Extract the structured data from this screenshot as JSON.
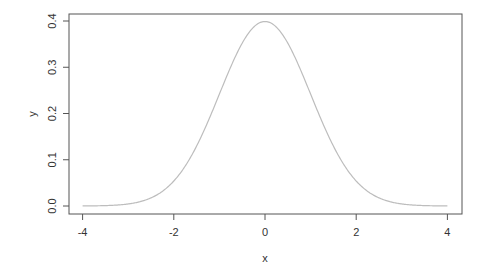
{
  "chart_data": {
    "type": "line",
    "title": "",
    "xlabel": "x",
    "ylabel": "y",
    "xlim": [
      -4.3,
      4.3
    ],
    "ylim": [
      -0.016,
      0.416
    ],
    "x_ticks": [
      "-4",
      "-2",
      "0",
      "2",
      "4"
    ],
    "y_ticks": [
      "0.0",
      "0.1",
      "0.2",
      "0.3",
      "0.4"
    ],
    "grid": false,
    "legend": null,
    "series": [
      {
        "name": "dnorm(x)",
        "color": "#bdbdbd",
        "x": [
          -4,
          -3.5,
          -3,
          -2.5,
          -2,
          -1.5,
          -1,
          -0.5,
          0,
          0.5,
          1,
          1.5,
          2,
          2.5,
          3,
          3.5,
          4
        ],
        "y": [
          0.0001,
          0.0009,
          0.0044,
          0.0175,
          0.054,
          0.1295,
          0.242,
          0.3521,
          0.3989,
          0.3521,
          0.242,
          0.1295,
          0.054,
          0.0175,
          0.0044,
          0.0009,
          0.0001
        ]
      }
    ]
  }
}
